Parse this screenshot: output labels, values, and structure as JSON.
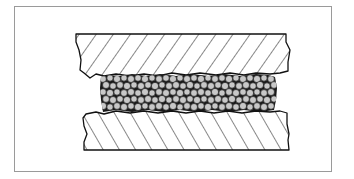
{
  "diagram": {
    "kind": "cross-section",
    "description_elements": [
      {
        "id": "top-plate",
        "label": "",
        "hatch": "forward-diagonal"
      },
      {
        "id": "granular-layer",
        "label": "",
        "fill": "particles"
      },
      {
        "id": "bottom-plate",
        "label": "",
        "hatch": "back-diagonal"
      }
    ],
    "colors": {
      "frame": "#9a9a9a",
      "line": "#111111",
      "particle_fill": "#c8c8c8",
      "particle_outline": "#222222",
      "background": "#ffffff"
    }
  }
}
